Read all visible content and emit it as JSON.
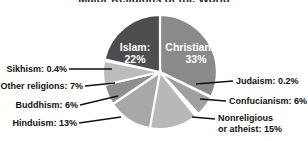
{
  "figure": {
    "title_remnant": "Major Religions of the World",
    "background_color": "#ffffff"
  },
  "chart_data": {
    "type": "pie",
    "title": "Major Religions of the World",
    "xlabel": "",
    "ylabel": "",
    "legend_position": "callout-labels",
    "grid": false,
    "start_angle_deg": 0,
    "direction": "clockwise",
    "categories": [
      "Christianity",
      "Judaism",
      "Confucianism",
      "Nonreligious or atheist",
      "Hinduism",
      "Buddhism",
      "Other religions",
      "Sikhism",
      "Islam"
    ],
    "values": [
      33,
      0.2,
      6,
      15,
      13,
      6,
      7,
      0.4,
      22
    ],
    "value_unit": "percent",
    "slice_colors": [
      "#8a8a8a",
      "#b4b4b4",
      "#a0a0a0",
      "#b8b8b8",
      "#a8a8a8",
      "#8e8e8e",
      "#bcbcbc",
      "#c8c8c8",
      "#4d4d4d"
    ],
    "slices": [
      {
        "label": "Christianity",
        "value": 33,
        "display": "Christianity:",
        "display_pct": "33%",
        "color": "#8a8a8a",
        "label_placement": "inside"
      },
      {
        "label": "Judaism",
        "value": 0.2,
        "display": "Judaism: 0.2%",
        "color": "#b4b4b4",
        "label_placement": "callout-right"
      },
      {
        "label": "Confucianism",
        "value": 6,
        "display": "Confucianism: 6%",
        "color": "#a0a0a0",
        "label_placement": "callout-right"
      },
      {
        "label": "Nonreligious or atheist",
        "value": 15,
        "display": "Nonreligious",
        "display_line2": "or atheist: 15%",
        "color": "#b8b8b8",
        "label_placement": "callout-right"
      },
      {
        "label": "Hinduism",
        "value": 13,
        "display": "Hinduism: 13%",
        "color": "#a8a8a8",
        "label_placement": "callout-left"
      },
      {
        "label": "Buddhism",
        "value": 6,
        "display": "Buddhism: 6%",
        "color": "#8e8e8e",
        "label_placement": "callout-left"
      },
      {
        "label": "Other religions",
        "value": 7,
        "display": "Other religions: 7%",
        "color": "#bcbcbc",
        "label_placement": "callout-left"
      },
      {
        "label": "Sikhism",
        "value": 0.4,
        "display": "Sikhism: 0.4%",
        "color": "#c8c8c8",
        "label_placement": "callout-left"
      },
      {
        "label": "Islam",
        "value": 22,
        "display": "Islam:",
        "display_pct": "22%",
        "color": "#4d4d4d",
        "label_placement": "inside"
      }
    ]
  },
  "labels": {
    "islam_name": "Islam:",
    "islam_pct": "22%",
    "christianity_name": "Christianity:",
    "christianity_pct": "33%",
    "sikhism": "Sikhism: 0.4%",
    "other_religions": "Other religions: 7%",
    "buddhism": "Buddhism: 6%",
    "hinduism": "Hinduism: 13%",
    "judaism": "Judaism: 0.2%",
    "confucianism": "Confucianism: 6%",
    "nonreligious_line1": "Nonreligious",
    "nonreligious_line2": "or atheist: 15%"
  }
}
